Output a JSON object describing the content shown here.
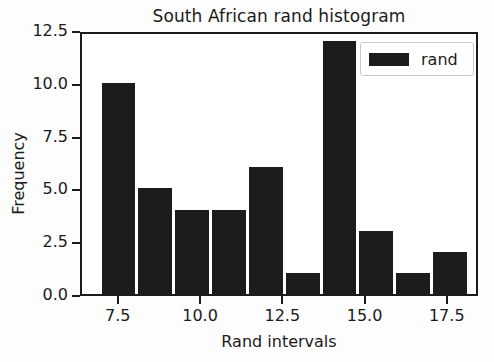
{
  "chart_data": {
    "type": "bar",
    "title": "South African rand histogram",
    "xlabel": "Rand intervals",
    "ylabel": "Frequency",
    "legend": [
      {
        "name": "rand",
        "color": "#1c1c1c"
      }
    ],
    "legend_position": "upper right",
    "grid": false,
    "xlim": [
      6.35,
      18.45
    ],
    "ylim": [
      0,
      12.5
    ],
    "xticks": [
      7.5,
      10.0,
      12.5,
      15.0,
      17.5
    ],
    "xtick_labels": [
      "7.5",
      "10.0",
      "12.5",
      "15.0",
      "17.5"
    ],
    "yticks": [
      0.0,
      2.5,
      5.0,
      7.5,
      10.0,
      12.5
    ],
    "ytick_labels": [
      "0.0",
      "2.5",
      "5.0",
      "7.5",
      "10.0",
      "12.5"
    ],
    "bin_edges": [
      6.9,
      18.1
    ],
    "series": [
      {
        "name": "rand",
        "color": "#1c1c1c",
        "bins": [
          {
            "left": 6.9,
            "right": 8.02,
            "value": 10
          },
          {
            "left": 8.02,
            "right": 9.14,
            "value": 5
          },
          {
            "left": 9.14,
            "right": 10.26,
            "value": 4
          },
          {
            "left": 10.26,
            "right": 11.38,
            "value": 4
          },
          {
            "left": 11.38,
            "right": 12.5,
            "value": 6
          },
          {
            "left": 12.5,
            "right": 13.62,
            "value": 1
          },
          {
            "left": 13.62,
            "right": 14.74,
            "value": 12
          },
          {
            "left": 14.74,
            "right": 15.86,
            "value": 3
          },
          {
            "left": 15.86,
            "right": 16.98,
            "value": 1
          },
          {
            "left": 16.98,
            "right": 18.1,
            "value": 2
          }
        ],
        "values": [
          10,
          5,
          4,
          4,
          6,
          1,
          12,
          3,
          1,
          2
        ]
      }
    ]
  }
}
